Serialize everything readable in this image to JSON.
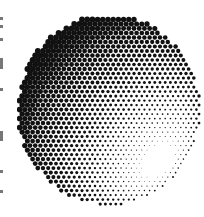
{
  "image": {
    "subject": "halftone-shaded sphere",
    "style": "halftone dot pattern",
    "colors": {
      "background": "#ffffff",
      "ink": "#111111"
    },
    "edge_marks": [
      {
        "top": 17,
        "height": 3
      },
      {
        "top": 25,
        "height": 3
      },
      {
        "top": 38,
        "height": 3
      },
      {
        "top": 58,
        "height": 11
      },
      {
        "top": 88,
        "height": 3
      },
      {
        "top": 131,
        "height": 10
      },
      {
        "top": 170,
        "height": 3
      },
      {
        "top": 190,
        "height": 3
      }
    ]
  }
}
